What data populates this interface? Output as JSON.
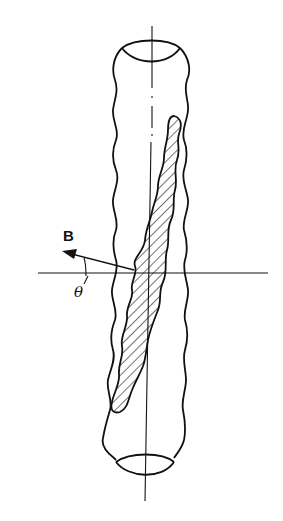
{
  "diagram": {
    "type": "technical-line-drawing",
    "labels": {
      "field_vector": "B",
      "angle": "θ"
    },
    "colors": {
      "line": "#111111",
      "background": "#ffffff"
    }
  }
}
